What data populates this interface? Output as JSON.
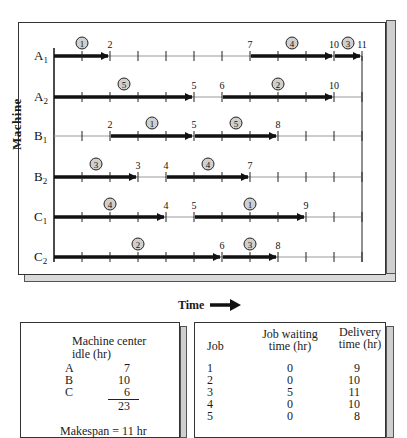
{
  "chart_data": {
    "type": "gantt",
    "title": "",
    "xlabel": "Time",
    "ylabel": "Machine",
    "xlim": [
      0,
      11
    ],
    "rows": [
      {
        "machine": "A1",
        "sub": "1",
        "letter": "A",
        "segments": [
          {
            "job": 1,
            "start": 0,
            "end": 2
          },
          {
            "job": 4,
            "start": 7,
            "end": 10
          },
          {
            "job": 3,
            "start": 10,
            "end": 11
          }
        ],
        "labels": [
          2,
          7,
          10,
          11
        ]
      },
      {
        "machine": "A2",
        "sub": "2",
        "letter": "A",
        "segments": [
          {
            "job": 5,
            "start": 0,
            "end": 5
          },
          {
            "job": 2,
            "start": 6,
            "end": 10
          }
        ],
        "labels": [
          5,
          6,
          10
        ]
      },
      {
        "machine": "B1",
        "sub": "1",
        "letter": "B",
        "segments": [
          {
            "job": 1,
            "start": 2,
            "end": 5
          },
          {
            "job": 5,
            "start": 5,
            "end": 8
          }
        ],
        "labels": [
          2,
          5,
          8
        ]
      },
      {
        "machine": "B2",
        "sub": "2",
        "letter": "B",
        "segments": [
          {
            "job": 3,
            "start": 0,
            "end": 3
          },
          {
            "job": 4,
            "start": 4,
            "end": 7
          }
        ],
        "labels": [
          3,
          4,
          7
        ]
      },
      {
        "machine": "C1",
        "sub": "1",
        "letter": "C",
        "segments": [
          {
            "job": 4,
            "start": 0,
            "end": 4
          },
          {
            "job": 1,
            "start": 5,
            "end": 9
          }
        ],
        "labels": [
          4,
          5,
          9
        ]
      },
      {
        "machine": "C2",
        "sub": "2",
        "letter": "C",
        "segments": [
          {
            "job": 2,
            "start": 0,
            "end": 6
          },
          {
            "job": 3,
            "start": 6,
            "end": 8
          }
        ],
        "labels": [
          6,
          8
        ]
      }
    ]
  },
  "axis": {
    "machine_label": "Machine",
    "time_label": "Time"
  },
  "idle_panel": {
    "title_line1": "Machine center",
    "title_line2": "idle (hr)",
    "rows": [
      {
        "center": "A",
        "hours": "7"
      },
      {
        "center": "B",
        "hours": "10"
      },
      {
        "center": "C",
        "hours": "6"
      }
    ],
    "total": "23",
    "makespan": "Makespan = 11 hr"
  },
  "job_panel": {
    "headers": {
      "job": "Job",
      "waiting_line1": "Job waiting",
      "waiting_line2": "time (hr)",
      "delivery_line1": "Delivery",
      "delivery_line2": "time (hr)"
    },
    "rows": [
      {
        "job": "1",
        "waiting": "0",
        "delivery": "9"
      },
      {
        "job": "2",
        "waiting": "0",
        "delivery": "10"
      },
      {
        "job": "3",
        "waiting": "5",
        "delivery": "11"
      },
      {
        "job": "4",
        "waiting": "0",
        "delivery": "10"
      },
      {
        "job": "5",
        "waiting": "0",
        "delivery": "8"
      }
    ]
  }
}
